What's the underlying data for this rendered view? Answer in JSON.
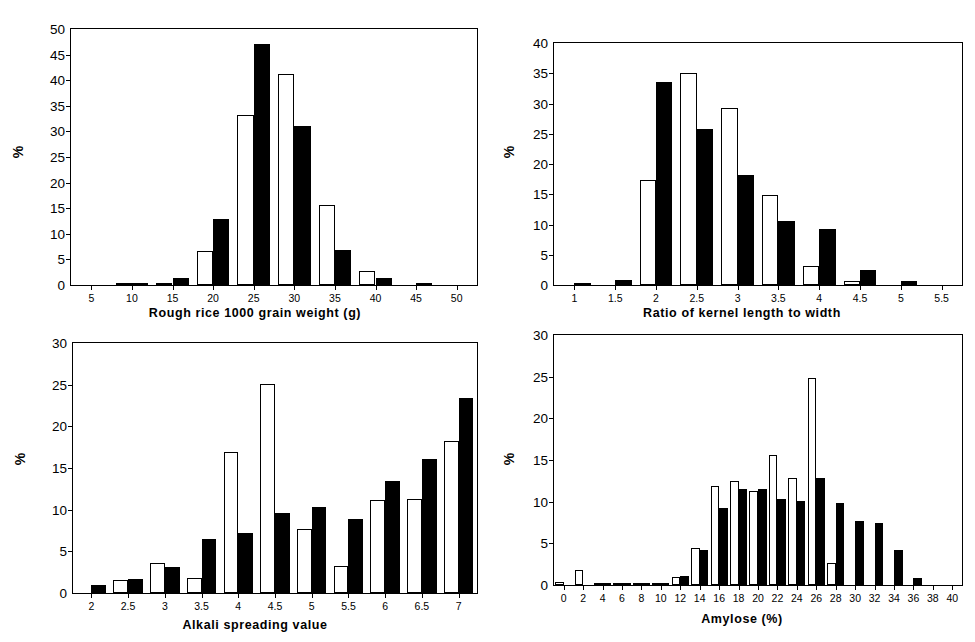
{
  "figure": {
    "ylabel": "%",
    "series_names": [
      "white",
      "black"
    ]
  },
  "panels": [
    {
      "id": "panel-1",
      "xtitle": "Rough rice 1000 grain weight (g)",
      "ylabel": "%"
    },
    {
      "id": "panel-2",
      "xtitle": "Ratio of kernel length to width",
      "ylabel": "%"
    },
    {
      "id": "panel-3",
      "xtitle": "Alkali spreading value",
      "ylabel": "%"
    },
    {
      "id": "panel-4",
      "xtitle": "Amylose (%)",
      "ylabel": "%"
    }
  ],
  "chart_data": [
    {
      "type": "bar",
      "title": "",
      "xlabel": "Rough rice 1000 grain weight (g)",
      "ylabel": "%",
      "categories": [
        "5",
        "10",
        "15",
        "20",
        "25",
        "30",
        "35",
        "40",
        "45",
        "50"
      ],
      "xticks": [
        5,
        10,
        15,
        20,
        25,
        30,
        35,
        40,
        45,
        50
      ],
      "yticks": [
        0,
        5,
        10,
        15,
        20,
        25,
        30,
        35,
        40,
        45,
        50
      ],
      "ylim": [
        0,
        50
      ],
      "grid": false,
      "legend": "none",
      "series": [
        {
          "name": "white",
          "values": [
            0,
            0.2,
            0.3,
            6.6,
            33.3,
            41.3,
            15.7,
            2.7,
            0,
            0
          ]
        },
        {
          "name": "black",
          "values": [
            0,
            0.3,
            1.3,
            12.9,
            47.0,
            31.1,
            6.9,
            1.3,
            0.3,
            0
          ]
        }
      ]
    },
    {
      "type": "bar",
      "title": "",
      "xlabel": "Ratio of kernel length to width",
      "ylabel": "%",
      "categories": [
        "1",
        "1.5",
        "2",
        "2.5",
        "3",
        "3.5",
        "4",
        "4.5",
        "5",
        "5.5"
      ],
      "xticks": [
        1,
        1.5,
        2,
        2.5,
        3,
        3.5,
        4,
        4.5,
        5,
        5.5
      ],
      "yticks": [
        0,
        5,
        10,
        15,
        20,
        25,
        30,
        35,
        40
      ],
      "ylim": [
        0,
        40
      ],
      "grid": false,
      "legend": "none",
      "series": [
        {
          "name": "white",
          "values": [
            0,
            0,
            17.4,
            35.0,
            29.3,
            14.9,
            3.1,
            0.6,
            0,
            0
          ]
        },
        {
          "name": "black",
          "values": [
            0.3,
            0.8,
            33.5,
            25.8,
            18.2,
            10.6,
            9.2,
            2.4,
            0.6,
            0
          ]
        }
      ]
    },
    {
      "type": "bar",
      "title": "",
      "xlabel": "Alkali spreading value",
      "ylabel": "%",
      "categories": [
        "2",
        "2.5",
        "3",
        "3.5",
        "4",
        "4.5",
        "5",
        "5.5",
        "6",
        "6.5",
        "7"
      ],
      "xticks": [
        2,
        2.5,
        3,
        3.5,
        4,
        4.5,
        5,
        5.5,
        6,
        6.5,
        7
      ],
      "yticks": [
        0,
        5,
        10,
        15,
        20,
        25,
        30
      ],
      "ylim": [
        0,
        30
      ],
      "grid": false,
      "legend": "none",
      "series": [
        {
          "name": "white",
          "values": [
            0,
            1.6,
            3.6,
            1.8,
            16.9,
            25.1,
            7.7,
            3.3,
            11.2,
            11.3,
            18.2
          ]
        },
        {
          "name": "black",
          "values": [
            1.0,
            1.7,
            3.1,
            6.5,
            7.2,
            9.6,
            10.3,
            8.9,
            13.5,
            16.1,
            23.4
          ]
        }
      ]
    },
    {
      "type": "bar",
      "title": "",
      "xlabel": "Amylose (%)",
      "ylabel": "%",
      "categories": [
        "0",
        "2",
        "4",
        "6",
        "8",
        "10",
        "12",
        "14",
        "16",
        "18",
        "20",
        "22",
        "24",
        "26",
        "28",
        "30",
        "32",
        "34",
        "36",
        "38",
        "40"
      ],
      "xticks": [
        0,
        2,
        4,
        6,
        8,
        10,
        12,
        14,
        16,
        18,
        20,
        22,
        24,
        26,
        28,
        30,
        32,
        34,
        36,
        38,
        40
      ],
      "yticks": [
        0,
        5,
        10,
        15,
        20,
        25,
        30
      ],
      "ylim": [
        0,
        30
      ],
      "grid": false,
      "legend": "none",
      "series": [
        {
          "name": "white",
          "values": [
            0.4,
            1.8,
            0.15,
            0.15,
            0.15,
            0.15,
            1.0,
            4.5,
            11.9,
            12.5,
            11.3,
            15.6,
            12.9,
            24.8,
            2.7,
            0,
            0,
            0,
            0,
            0,
            0
          ]
        },
        {
          "name": "black",
          "values": [
            0,
            0,
            0.1,
            0.1,
            0.15,
            0.15,
            1.1,
            4.2,
            9.2,
            11.5,
            11.5,
            10.3,
            10.1,
            12.8,
            9.8,
            7.7,
            7.4,
            4.2,
            0.8,
            0,
            0
          ]
        }
      ]
    }
  ]
}
